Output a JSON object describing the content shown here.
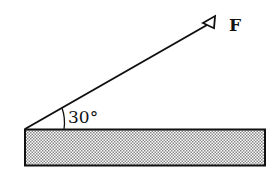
{
  "diagram": {
    "force_label": "F",
    "angle_label": "30°",
    "angle_degrees": 30,
    "colors": {
      "stroke": "#111111",
      "background": "#ffffff",
      "hatch": "#9a9a9a"
    }
  }
}
